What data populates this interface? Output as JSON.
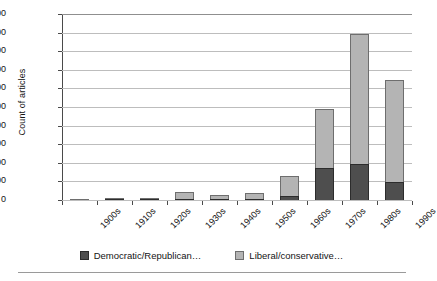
{
  "chart_data": {
    "type": "bar",
    "subtype": "stacked-vertical",
    "title": "",
    "xlabel": "",
    "ylabel": "Count of articles",
    "categories": [
      "1900s",
      "1910s",
      "1920s",
      "1930s",
      "1940s",
      "1950s",
      "1960s",
      "1970s",
      "1980s",
      "1990s"
    ],
    "series": [
      {
        "name": "Democratic/Republican…",
        "color": "#4e4e4e",
        "values": [
          4,
          6,
          6,
          10,
          6,
          8,
          45,
          348,
          382,
          196
        ]
      },
      {
        "name": "Liberal/conservative…",
        "color": "#b4b4b4",
        "values": [
          11,
          9,
          14,
          80,
          46,
          68,
          215,
          627,
          1408,
          1099
        ]
      }
    ],
    "totals": [
      15,
      15,
      20,
      90,
      52,
      76,
      260,
      975,
      1790,
      1295
    ],
    "ylim": [
      0,
      2000
    ],
    "y_ticks": [
      0,
      200,
      400,
      600,
      800,
      1000,
      1200,
      1400,
      1600,
      1800,
      2000
    ],
    "y_tick_labels": [
      "0",
      "200",
      "400",
      "600",
      "800",
      "1,000",
      "1,200",
      "1,400",
      "1,600",
      "1,800",
      "2,000"
    ],
    "grid": "horizontal",
    "legend_position": "bottom-center",
    "x_tick_label_rotation": -45
  },
  "axes": {
    "y_title": "Count of articles"
  },
  "legend": {
    "items": [
      {
        "label": "Democratic/Republican…",
        "swatch": "dark-gray-square"
      },
      {
        "label": "Liberal/conservative…",
        "swatch": "light-gray-square"
      }
    ]
  }
}
